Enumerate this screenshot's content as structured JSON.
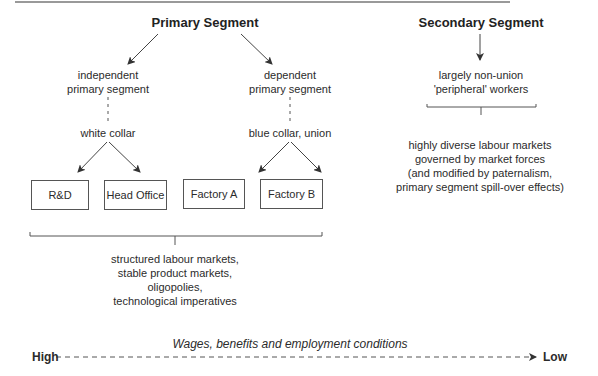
{
  "primary": {
    "title": "Primary Segment",
    "independent": {
      "line1": "independent",
      "line2": "primary segment",
      "sub": "white collar"
    },
    "dependent": {
      "line1": "dependent",
      "line2": "primary segment",
      "sub": "blue collar, union"
    },
    "boxes": [
      "R&D",
      "Head Office",
      "Factory A",
      "Factory B"
    ],
    "characteristics": [
      "structured labour markets,",
      "stable product markets,",
      "oligopolies,",
      "technological imperatives"
    ]
  },
  "secondary": {
    "title": "Secondary Segment",
    "workers": {
      "line1": "largely non-union",
      "line2": "'peripheral' workers"
    },
    "characteristics": [
      "highly diverse labour markets",
      "governed by market forces",
      "(and modified by paternalism,",
      "primary segment spill-over effects)"
    ]
  },
  "axis": {
    "caption": "Wages, benefits and employment conditions",
    "left": "High",
    "right": "Low"
  },
  "colors": {
    "line": "#444444",
    "text": "#2b2b2b"
  }
}
